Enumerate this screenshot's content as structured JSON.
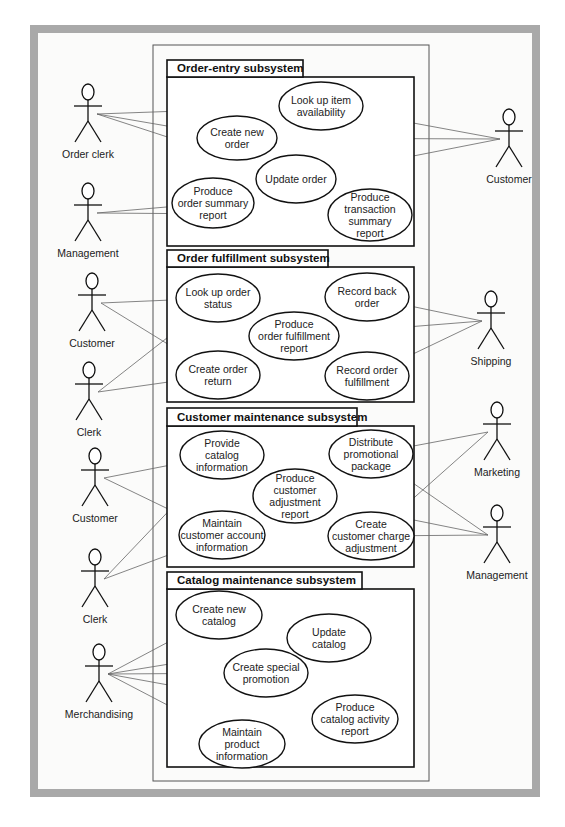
{
  "diagram": {
    "type": "uml-use-case",
    "subsystems": [
      {
        "id": "order-entry",
        "title": "Order-entry subsystem",
        "use_cases": [
          {
            "id": "look-up-item-availability",
            "lines": [
              "Look up item",
              "availability"
            ]
          },
          {
            "id": "create-new-order",
            "lines": [
              "Create new",
              "order"
            ]
          },
          {
            "id": "update-order",
            "lines": [
              "Update order"
            ]
          },
          {
            "id": "produce-order-summary-report",
            "lines": [
              "Produce",
              "order summary",
              "report"
            ]
          },
          {
            "id": "produce-transaction-summary-report",
            "lines": [
              "Produce",
              "transaction",
              "summary",
              "report"
            ]
          }
        ]
      },
      {
        "id": "order-fulfillment",
        "title": "Order fulfillment subsystem",
        "use_cases": [
          {
            "id": "look-up-order-status",
            "lines": [
              "Look up order",
              "status"
            ]
          },
          {
            "id": "record-back-order",
            "lines": [
              "Record back",
              "order"
            ]
          },
          {
            "id": "produce-order-fulfillment-report",
            "lines": [
              "Produce",
              "order fulfillment",
              "report"
            ]
          },
          {
            "id": "create-order-return",
            "lines": [
              "Create order",
              "return"
            ]
          },
          {
            "id": "record-order-fulfillment",
            "lines": [
              "Record order",
              "fulfillment"
            ]
          }
        ]
      },
      {
        "id": "customer-maintenance",
        "title": "Customer maintenance subsystem",
        "use_cases": [
          {
            "id": "provide-catalog-information",
            "lines": [
              "Provide",
              "catalog",
              "information"
            ]
          },
          {
            "id": "distribute-promotional-package",
            "lines": [
              "Distribute",
              "promotional",
              "package"
            ]
          },
          {
            "id": "produce-customer-adjustment-report",
            "lines": [
              "Produce",
              "customer",
              "adjustment",
              "report"
            ]
          },
          {
            "id": "maintain-customer-account-information",
            "lines": [
              "Maintain",
              "customer account",
              "information"
            ]
          },
          {
            "id": "create-customer-charge-adjustment",
            "lines": [
              "Create",
              "customer charge",
              "adjustment"
            ]
          }
        ]
      },
      {
        "id": "catalog-maintenance",
        "title": "Catalog maintenance subsystem",
        "use_cases": [
          {
            "id": "create-new-catalog",
            "lines": [
              "Create new",
              "catalog"
            ]
          },
          {
            "id": "update-catalog",
            "lines": [
              "Update",
              "catalog"
            ]
          },
          {
            "id": "create-special-promotion",
            "lines": [
              "Create special",
              "promotion"
            ]
          },
          {
            "id": "produce-catalog-activity-report",
            "lines": [
              "Produce",
              "catalog activity",
              "report"
            ]
          },
          {
            "id": "maintain-product-information",
            "lines": [
              "Maintain",
              "product",
              "information"
            ]
          }
        ]
      }
    ],
    "actors": [
      {
        "id": "order-clerk",
        "label": "Order clerk"
      },
      {
        "id": "management-1",
        "label": "Management"
      },
      {
        "id": "customer-1",
        "label": "Customer"
      },
      {
        "id": "customer-2",
        "label": "Customer"
      },
      {
        "id": "clerk-1",
        "label": "Clerk"
      },
      {
        "id": "shipping",
        "label": "Shipping"
      },
      {
        "id": "customer-3",
        "label": "Customer"
      },
      {
        "id": "clerk-2",
        "label": "Clerk"
      },
      {
        "id": "marketing",
        "label": "Marketing"
      },
      {
        "id": "management-2",
        "label": "Management"
      },
      {
        "id": "merchandising",
        "label": "Merchandising"
      }
    ],
    "associations": [
      [
        "order-clerk",
        "look-up-item-availability"
      ],
      [
        "order-clerk",
        "create-new-order"
      ],
      [
        "order-clerk",
        "update-order"
      ],
      [
        "customer-1",
        "look-up-item-availability"
      ],
      [
        "customer-1",
        "create-new-order"
      ],
      [
        "customer-1",
        "update-order"
      ],
      [
        "management-1",
        "produce-order-summary-report"
      ],
      [
        "management-1",
        "produce-transaction-summary-report"
      ],
      [
        "customer-2",
        "look-up-order-status"
      ],
      [
        "customer-2",
        "create-order-return"
      ],
      [
        "clerk-1",
        "look-up-order-status"
      ],
      [
        "clerk-1",
        "create-order-return"
      ],
      [
        "shipping",
        "record-back-order"
      ],
      [
        "shipping",
        "produce-order-fulfillment-report"
      ],
      [
        "shipping",
        "record-order-fulfillment"
      ],
      [
        "customer-3",
        "provide-catalog-information"
      ],
      [
        "customer-3",
        "maintain-customer-account-information"
      ],
      [
        "clerk-2",
        "provide-catalog-information"
      ],
      [
        "clerk-2",
        "maintain-customer-account-information"
      ],
      [
        "marketing",
        "distribute-promotional-package"
      ],
      [
        "marketing",
        "create-customer-charge-adjustment"
      ],
      [
        "management-2",
        "distribute-promotional-package"
      ],
      [
        "management-2",
        "produce-customer-adjustment-report"
      ],
      [
        "management-2",
        "create-customer-charge-adjustment"
      ],
      [
        "merchandising",
        "create-new-catalog"
      ],
      [
        "merchandising",
        "update-catalog"
      ],
      [
        "merchandising",
        "create-special-promotion"
      ],
      [
        "merchandising",
        "produce-catalog-activity-report"
      ],
      [
        "merchandising",
        "maintain-product-information"
      ]
    ]
  },
  "colors": {
    "frame": "#a9a9a9",
    "background": "#fbfbfa",
    "line": "#111111",
    "association": "#666666"
  }
}
